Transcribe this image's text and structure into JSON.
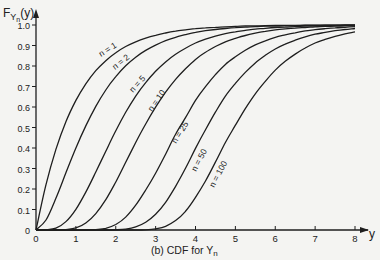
{
  "chart_data": {
    "type": "line",
    "xlabel": "y",
    "ylabel": "F_{Y_n}(y)",
    "xlim": [
      0,
      8
    ],
    "ylim": [
      0,
      1.0
    ],
    "grid": false,
    "legend": "inline curve labels",
    "x_ticks": [
      "0",
      "1",
      "2",
      "3",
      "4",
      "5",
      "6",
      "7",
      "8"
    ],
    "y_ticks": [
      "0",
      "0.1",
      "0.2",
      "0.3",
      "0.4",
      "0.5",
      "0.6",
      "0.7",
      "0.8",
      "0.9",
      "1.0"
    ],
    "x": [
      0,
      0.25,
      0.5,
      0.75,
      1,
      1.25,
      1.5,
      1.75,
      2,
      2.25,
      2.5,
      2.75,
      3,
      3.25,
      3.5,
      3.75,
      4,
      4.25,
      4.5,
      4.75,
      5,
      5.25,
      5.5,
      5.75,
      6,
      6.25,
      6.5,
      6.75,
      7,
      7.25,
      7.5,
      7.75,
      8
    ],
    "series": [
      {
        "name": "n = 1",
        "values": [
          0,
          0.221,
          0.393,
          0.528,
          0.632,
          0.713,
          0.777,
          0.826,
          0.865,
          0.895,
          0.918,
          0.936,
          0.95,
          0.961,
          0.97,
          0.976,
          0.982,
          0.986,
          0.989,
          0.991,
          0.993,
          0.995,
          0.996,
          0.997,
          0.998,
          0.998,
          0.998,
          0.999,
          0.999,
          0.999,
          0.999,
          1.0,
          1.0
        ]
      },
      {
        "name": "n = 2",
        "values": [
          0,
          0.049,
          0.155,
          0.279,
          0.4,
          0.508,
          0.603,
          0.683,
          0.748,
          0.801,
          0.843,
          0.876,
          0.902,
          0.924,
          0.94,
          0.953,
          0.964,
          0.972,
          0.978,
          0.983,
          0.987,
          0.99,
          0.992,
          0.994,
          0.995,
          0.996,
          0.997,
          0.998,
          0.998,
          0.999,
          0.999,
          0.999,
          0.999
        ]
      },
      {
        "name": "n = 5",
        "values": [
          0,
          0.001,
          0.009,
          0.041,
          0.101,
          0.185,
          0.283,
          0.384,
          0.484,
          0.574,
          0.653,
          0.719,
          0.774,
          0.82,
          0.857,
          0.887,
          0.912,
          0.931,
          0.946,
          0.958,
          0.967,
          0.974,
          0.98,
          0.984,
          0.988,
          0.99,
          0.992,
          0.994,
          0.995,
          0.996,
          0.997,
          0.998,
          0.998
        ]
      },
      {
        "name": "n = 10",
        "values": [
          0,
          0,
          0,
          0.002,
          0.01,
          0.034,
          0.08,
          0.148,
          0.234,
          0.33,
          0.427,
          0.517,
          0.599,
          0.672,
          0.735,
          0.787,
          0.832,
          0.867,
          0.895,
          0.918,
          0.935,
          0.949,
          0.96,
          0.969,
          0.976,
          0.981,
          0.985,
          0.988,
          0.991,
          0.993,
          0.994,
          0.996,
          0.997
        ]
      },
      {
        "name": "n = 25",
        "values": [
          0,
          0,
          0,
          0,
          0,
          0,
          0.002,
          0.008,
          0.027,
          0.063,
          0.121,
          0.195,
          0.277,
          0.37,
          0.467,
          0.548,
          0.632,
          0.699,
          0.758,
          0.808,
          0.845,
          0.877,
          0.903,
          0.923,
          0.94,
          0.952,
          0.962,
          0.971,
          0.977,
          0.982,
          0.986,
          0.989,
          0.992
        ]
      },
      {
        "name": "n = 50",
        "values": [
          0,
          0,
          0,
          0,
          0,
          0,
          0,
          0,
          0.001,
          0.004,
          0.015,
          0.038,
          0.077,
          0.135,
          0.213,
          0.301,
          0.398,
          0.489,
          0.575,
          0.653,
          0.715,
          0.769,
          0.815,
          0.852,
          0.883,
          0.907,
          0.926,
          0.942,
          0.955,
          0.964,
          0.972,
          0.978,
          0.983
        ]
      },
      {
        "name": "n = 100",
        "values": [
          0,
          0,
          0,
          0,
          0,
          0,
          0,
          0,
          0,
          0,
          0,
          0.001,
          0.006,
          0.018,
          0.046,
          0.091,
          0.159,
          0.239,
          0.331,
          0.427,
          0.511,
          0.592,
          0.664,
          0.725,
          0.78,
          0.823,
          0.858,
          0.888,
          0.912,
          0.93,
          0.945,
          0.957,
          0.967
        ]
      }
    ],
    "annotations": [
      "n = 1",
      "n = 2",
      "n = 5",
      "n = 10",
      "n = 25",
      "n = 50",
      "n = 100"
    ]
  },
  "axes": {
    "y_label_main": "F",
    "y_label_sub": "Y",
    "y_label_subsub": "n",
    "y_label_arg": "(y)",
    "x_label": "y",
    "caption_prefix": "(b) CDF for Y",
    "caption_sub": "n"
  },
  "colors": {
    "background": "#f4f4f2",
    "ink": "#1e1e1e"
  },
  "label_positions": [
    {
      "text": "n = 1",
      "x": 101,
      "y": 57,
      "angle": -32
    },
    {
      "text": "n = 2",
      "x": 115,
      "y": 70,
      "angle": -38
    },
    {
      "text": "n = 5",
      "x": 133,
      "y": 93,
      "angle": -48
    },
    {
      "text": "n = 10",
      "x": 152,
      "y": 112,
      "angle": -55
    },
    {
      "text": "n = 25",
      "x": 176,
      "y": 144,
      "angle": -58
    },
    {
      "text": "n = 50",
      "x": 196,
      "y": 172,
      "angle": -62
    },
    {
      "text": "n = 100",
      "x": 214,
      "y": 188,
      "angle": -62
    }
  ]
}
